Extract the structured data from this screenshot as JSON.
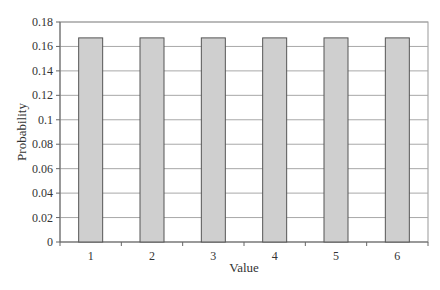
{
  "chart_data": {
    "type": "bar",
    "title": "",
    "xlabel": "Value",
    "ylabel": "Probability",
    "categories": [
      "1",
      "2",
      "3",
      "4",
      "5",
      "6"
    ],
    "values": [
      0.167,
      0.167,
      0.167,
      0.167,
      0.167,
      0.167
    ],
    "ylim": [
      0,
      0.18
    ],
    "yticks": [
      0,
      0.02,
      0.04,
      0.06,
      0.08,
      0.1,
      0.12,
      0.14,
      0.16,
      0.18
    ],
    "ytick_labels": [
      "0",
      "0.02",
      "0.04",
      "0.06",
      "0.08",
      "0.1",
      "0.12",
      "0.14",
      "0.16",
      "0.18"
    ],
    "grid": true,
    "legend": "none",
    "colors": {
      "bar_fill": "#cfcfcf",
      "bar_stroke": "#555555",
      "grid": "#a8a8a8",
      "axis": "#666666",
      "frame": "#999999"
    }
  }
}
